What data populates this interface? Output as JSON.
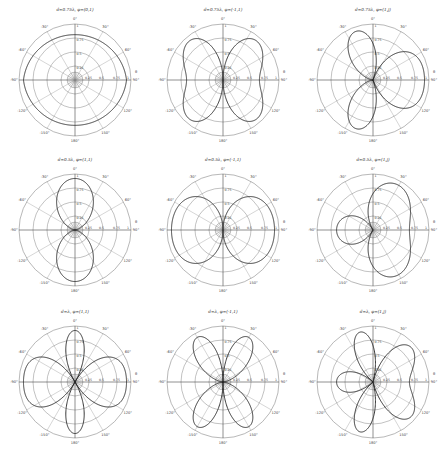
{
  "figure": {
    "layout": {
      "rows": 3,
      "cols": 3
    },
    "angle_ticks": [
      "0°",
      "30°",
      "60°",
      "90°",
      "120°",
      "150°",
      "180°",
      "-150°",
      "-120°",
      "-90°",
      "-60°",
      "-30°"
    ],
    "radial_ticks": [
      "0.25",
      "0.5",
      "0.75",
      "1"
    ],
    "axis_symbol": "θ"
  },
  "chart_data": [
    {
      "type": "polar",
      "title": "d=0.75λ, φ=(0,1)",
      "d": 0.75,
      "excitation": [
        1,
        0
      ],
      "phase_deg": 0,
      "shape": "near-circular (single element)",
      "rlim": [
        0,
        1
      ]
    },
    {
      "type": "polar",
      "title": "d=0.75λ, φ=(-1,1)",
      "d": 0.75,
      "excitation": [
        1,
        1
      ],
      "phase_deg": 180,
      "shape": "two vertical lobes (0° and 180°)",
      "rlim": [
        0,
        1
      ]
    },
    {
      "type": "polar",
      "title": "d=0.75λ, φ=(1,j)",
      "d": 0.75,
      "excitation": [
        1,
        1
      ],
      "phase_deg": 90,
      "shape": "cardioid-like, max upward",
      "rlim": [
        0,
        1
      ]
    },
    {
      "type": "polar",
      "title": "d=0.5λ, φ=(1,1)",
      "d": 0.5,
      "excitation": [
        1,
        1
      ],
      "phase_deg": 0,
      "shape": "two horizontal lobes (±90°)",
      "rlim": [
        0,
        1
      ]
    },
    {
      "type": "polar",
      "title": "d=0.5λ, φ=(-1,1)",
      "d": 0.5,
      "excitation": [
        1,
        1
      ],
      "phase_deg": 180,
      "shape": "two vertical lobes (0° and 180°)",
      "rlim": [
        0,
        1
      ]
    },
    {
      "type": "polar",
      "title": "d=0.5λ, φ=(1,j)",
      "d": 0.5,
      "excitation": [
        1,
        1
      ],
      "phase_deg": -90,
      "shape": "broad upper lobe + small lower lobe",
      "rlim": [
        0,
        1
      ]
    },
    {
      "type": "polar",
      "title": "d=λ, φ=(1,1)",
      "d": 1.0,
      "excitation": [
        1,
        1
      ],
      "phase_deg": 0,
      "shape": "four lobes: 0°, 180°, ±90°",
      "rlim": [
        0,
        1
      ]
    },
    {
      "type": "polar",
      "title": "d=λ, φ=(-1,1)",
      "d": 1.0,
      "excitation": [
        1,
        1
      ],
      "phase_deg": 180,
      "shape": "four diagonal lobes (±60°, ±120°)",
      "rlim": [
        0,
        1
      ]
    },
    {
      "type": "polar",
      "title": "d=λ, φ=(1,j)",
      "d": 1.0,
      "excitation": [
        1,
        1
      ],
      "phase_deg": 90,
      "shape": "five lobes incl. narrow top lobe",
      "rlim": [
        0,
        1
      ]
    }
  ]
}
